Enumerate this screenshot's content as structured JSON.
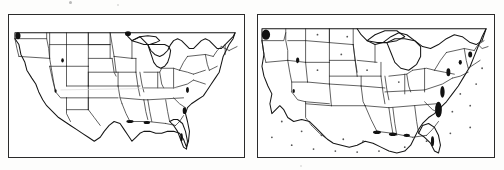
{
  "figure": {
    "kind": "scanned-figure",
    "background_color": "#fdfdfc",
    "ink_color": "#151515",
    "width_px": 504,
    "height_px": 170
  },
  "panels": [
    {
      "id": "panel-left",
      "name": "conventional-us-map",
      "caption": "",
      "frame": {
        "x": 8,
        "y": 14,
        "width": 237,
        "height": 144
      },
      "projection_note": "undistorted geographic outline with state boundaries",
      "has_grid_dots": false,
      "dark_coastal_marks": 9
    },
    {
      "id": "panel-right",
      "name": "distorted-us-cartogram",
      "caption": "",
      "frame": {
        "x": 257,
        "y": 14,
        "width": 238,
        "height": 144
      },
      "projection_note": "area-distorted cartogram; eastern states enlarged, western states compressed",
      "has_grid_dots": true,
      "grid_dot_count": 26,
      "dark_coastal_marks": 12
    }
  ],
  "artifacts": {
    "specks": [
      {
        "x": 70,
        "y": 2,
        "r": 1.6
      },
      {
        "x": 118,
        "y": 5,
        "r": 0.8
      },
      {
        "x": 300,
        "y": 166,
        "r": 0.7
      }
    ]
  },
  "chart_data": {
    "type": "map",
    "title": "",
    "panels": [
      "conventional map",
      "distorted cartogram"
    ],
    "region": "contiguous United States",
    "states_outlined": [
      "WA",
      "OR",
      "CA",
      "NV",
      "ID",
      "MT",
      "WY",
      "UT",
      "AZ",
      "CO",
      "NM",
      "ND",
      "SD",
      "NE",
      "KS",
      "OK",
      "TX",
      "MN",
      "IA",
      "MO",
      "AR",
      "LA",
      "WI",
      "IL",
      "MS",
      "MI",
      "IN",
      "KY",
      "TN",
      "AL",
      "OH",
      "GA",
      "FL",
      "SC",
      "NC",
      "VA",
      "WV",
      "PA",
      "NY",
      "MD",
      "DE",
      "NJ",
      "CT",
      "RI",
      "MA",
      "VT",
      "NH",
      "ME"
    ],
    "legend": [],
    "grid": false
  }
}
